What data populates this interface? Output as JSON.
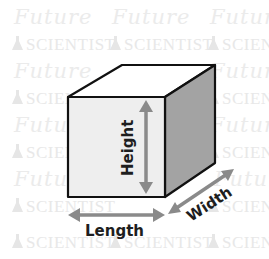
{
  "diagram": {
    "type": "rectangular-prism-dimensions",
    "labels": {
      "height": "Height",
      "length": "Length",
      "width": "Width"
    },
    "watermark": {
      "line1": "Future",
      "line2": "SCIENTIST",
      "icon": "flask-icon"
    },
    "colors": {
      "background": "#ffffff",
      "front_face": "#eeeeee",
      "top_face": "#ffffff",
      "side_face": "#a3a3a3",
      "edge": "#111111",
      "arrow": "#8a8a8a",
      "label_text": "#1e1e1e",
      "watermark": "#e8e8e8"
    }
  }
}
